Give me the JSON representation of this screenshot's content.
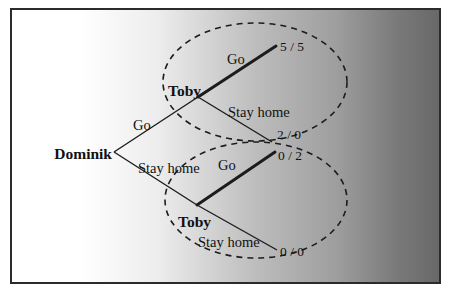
{
  "colors": {
    "frame_border": "#2b2b2b",
    "gradient_left": "#ffffff",
    "gradient_mid": "#bdbdbd",
    "gradient_right": "#686868",
    "line": "#1c1c1c",
    "text": "#111111"
  },
  "tree": {
    "root_player": "Dominik",
    "top_node_player": "Toby",
    "bottom_node_player": "Toby",
    "branch_labels": {
      "root_go": "Go",
      "root_stay": "Stay home",
      "top_go": "Go",
      "top_stay": "Stay home",
      "bottom_go": "Go",
      "bottom_stay": "Stay home"
    },
    "payoffs": {
      "go_go": "5 / 5",
      "go_stay": "2 / 0",
      "stay_go": "0 / 2",
      "stay_stay": "0 / 0"
    }
  }
}
